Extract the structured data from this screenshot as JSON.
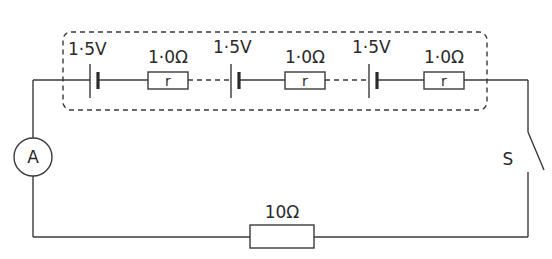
{
  "diagram": {
    "type": "circuit",
    "battery_box": {
      "style": "dashed-rounded-rectangle"
    },
    "cells": [
      {
        "emf_label": "1·5V",
        "internal_resistance_label": "1·0Ω",
        "resistor_symbol_label": "r"
      },
      {
        "emf_label": "1·5V",
        "internal_resistance_label": "1·0Ω",
        "resistor_symbol_label": "r"
      },
      {
        "emf_label": "1·5V",
        "internal_resistance_label": "1·0Ω",
        "resistor_symbol_label": "r"
      }
    ],
    "ammeter": {
      "label": "A"
    },
    "external_resistor": {
      "label": "10Ω"
    },
    "switch": {
      "label": "S",
      "state": "open"
    },
    "colors": {
      "line": "#3a3a3a",
      "text": "#2a2a2a",
      "background": "#ffffff"
    }
  }
}
